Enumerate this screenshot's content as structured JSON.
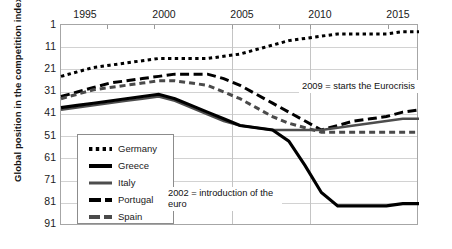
{
  "chart_data": {
    "type": "line",
    "title": "",
    "xlabel": "",
    "ylabel": "Global position in the competition index",
    "x": [
      1994,
      1995,
      1996,
      1997,
      1998,
      1999,
      2000,
      2001,
      2002,
      2003,
      2004,
      2005,
      2006,
      2007,
      2008,
      2009,
      2010,
      2011,
      2012,
      2013,
      2014,
      2015,
      2016
    ],
    "xticks": [
      "1995",
      "2000",
      "2005",
      "2010",
      "2015"
    ],
    "yticks": [
      "1",
      "11",
      "21",
      "31",
      "41",
      "51",
      "61",
      "71",
      "81",
      "91"
    ],
    "ylim": [
      1,
      91
    ],
    "y_inverted": true,
    "grid": true,
    "legend_position": "inner-left-lower",
    "series": [
      {
        "name": "Germany",
        "style": "dotted",
        "color": "#000000",
        "values": [
          24,
          22,
          20,
          19,
          18,
          17,
          16,
          16,
          16,
          16,
          15,
          14,
          12,
          10,
          8,
          7,
          6,
          5,
          5,
          5,
          5,
          4,
          4
        ]
      },
      {
        "name": "Greece",
        "style": "solid-thick",
        "color": "#000000",
        "values": [
          38,
          37,
          36,
          35,
          34,
          33,
          32,
          34,
          37,
          40,
          43,
          46,
          47,
          48,
          53,
          64,
          76,
          82,
          82,
          82,
          82,
          81,
          81
        ]
      },
      {
        "name": "Italy",
        "style": "solid-thin",
        "color": "#4d4d4d",
        "values": [
          39,
          38,
          37,
          36,
          35,
          34,
          33,
          35,
          38,
          41,
          44,
          46,
          47,
          48,
          48,
          48,
          48,
          47,
          46,
          45,
          44,
          43,
          43
        ]
      },
      {
        "name": "Portugal",
        "style": "dashed-long",
        "color": "#000000",
        "values": [
          33,
          31,
          29,
          27,
          26,
          25,
          24,
          23,
          23,
          23,
          25,
          28,
          32,
          36,
          40,
          44,
          48,
          46,
          44,
          43,
          42,
          40,
          39
        ]
      },
      {
        "name": "Spain",
        "style": "dashed-short",
        "color": "#4a4a4a",
        "values": [
          34,
          32,
          30,
          29,
          28,
          27,
          26,
          26,
          27,
          28,
          31,
          34,
          38,
          42,
          45,
          47,
          49,
          49,
          49,
          49,
          49,
          49,
          49
        ]
      }
    ],
    "annotations": [
      {
        "id": "a2009",
        "text": "2009 = starts the Eurocrisis"
      },
      {
        "id": "a2002",
        "text": "2002 = introduction of the euro"
      }
    ]
  },
  "legend": {
    "items": [
      {
        "label": "Germany"
      },
      {
        "label": "Greece"
      },
      {
        "label": "Italy"
      },
      {
        "label": "Portugal"
      },
      {
        "label": "Spain"
      }
    ]
  }
}
